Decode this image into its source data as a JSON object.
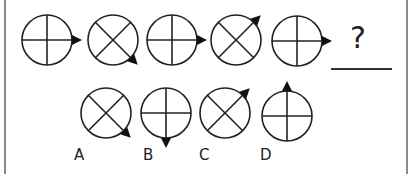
{
  "question": {
    "placeholder": "?",
    "sequence": [
      {
        "symbol": "plus-cross",
        "arrow": "right"
      },
      {
        "symbol": "x-cross",
        "arrow": "bottom-right"
      },
      {
        "symbol": "plus-cross",
        "arrow": "right"
      },
      {
        "symbol": "x-cross",
        "arrow": "top-right"
      },
      {
        "symbol": "plus-cross",
        "arrow": "right"
      }
    ]
  },
  "options": [
    {
      "label": "A",
      "symbol": "x-cross",
      "arrow": "bottom-right"
    },
    {
      "label": "B",
      "symbol": "plus-cross",
      "arrow": "bottom"
    },
    {
      "label": "C",
      "symbol": "x-cross",
      "arrow": "top-right"
    },
    {
      "label": "D",
      "symbol": "plus-cross",
      "arrow": "top"
    }
  ],
  "colors": {
    "stroke": "#222222",
    "border": "#8a8a8a",
    "background": "#ffffff"
  }
}
